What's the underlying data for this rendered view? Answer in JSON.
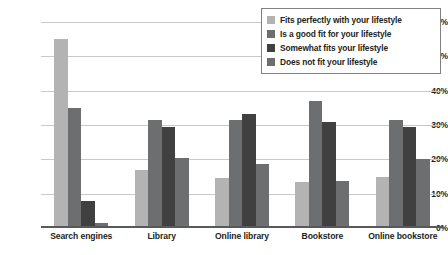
{
  "chart_data": {
    "type": "bar",
    "title": "",
    "subtitle": "",
    "xlabel": "",
    "ylabel": "",
    "ylim": [
      0,
      60
    ],
    "ytick_labels": [
      "60%",
      "50%",
      "40%",
      "30%",
      "20%",
      "10%",
      "0%"
    ],
    "ytick_values": [
      60,
      50,
      40,
      30,
      20,
      10,
      0
    ],
    "grid": true,
    "legend_position": "top-right",
    "categories": [
      "Search engines",
      "Library",
      "Online library",
      "Bookstore",
      "Online bookstore"
    ],
    "series": [
      {
        "name": "Fits perfectly with your lifestyle",
        "color": "#b3b3b3",
        "values": [
          55.0,
          16.8,
          14.5,
          13.5,
          14.8
        ]
      },
      {
        "name": "Is a good fit for your lifestyle",
        "color": "#6d6e70",
        "values": [
          35.0,
          31.5,
          31.5,
          37.0,
          31.5
        ]
      },
      {
        "name": "Somewhat fits your lifestyle",
        "color": "#404041",
        "values": [
          8.0,
          29.5,
          33.3,
          31.0,
          29.5
        ]
      },
      {
        "name": "Does not fit your lifestyle",
        "color": "#6d6e70",
        "values": [
          1.5,
          20.5,
          18.5,
          13.8,
          20.2
        ]
      }
    ]
  },
  "legend": {
    "items": [
      {
        "label": "Fits perfectly with your lifestyle",
        "color": "#b3b3b3"
      },
      {
        "label": "Is a good fit for your lifestyle",
        "color": "#6d6e70"
      },
      {
        "label": "Somewhat fits your lifestyle",
        "color": "#404041"
      },
      {
        "label": "Does not fit your lifestyle",
        "color": "#6d6e70"
      }
    ]
  },
  "colors": {
    "gridline": "#c9c9c9",
    "axis": "#58595b",
    "text": "#231f20",
    "background": "#ffffff",
    "legend_border": "#808080"
  }
}
